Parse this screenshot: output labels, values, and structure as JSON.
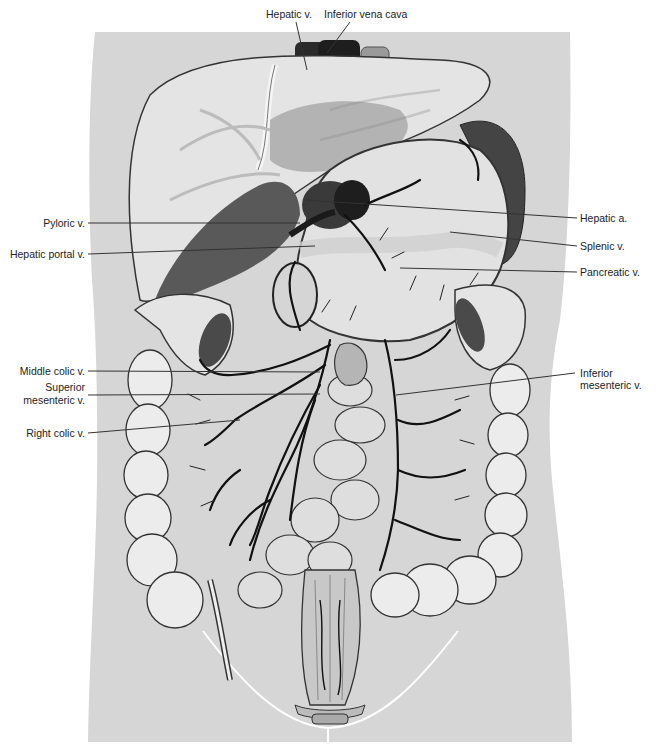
{
  "figure": {
    "colors": {
      "page_background": "#ffffff",
      "body_silhouette": "#d6d6d6",
      "organ_light": "#e8e8e8",
      "organ_mid": "#bdbdbd",
      "organ_dark": "#5a5a5a",
      "vessel": "#1a1a1a",
      "leader_line": "#333333",
      "pelvic_line": "#ffffff",
      "label_text": "#222222"
    }
  },
  "labels": {
    "top": [
      {
        "id": "hepatic-v",
        "text": "Hepatic v.",
        "x": 266,
        "y": 8
      },
      {
        "id": "inferior-vena-cava",
        "text": "Inferior vena cava",
        "x": 324,
        "y": 8
      }
    ],
    "left": [
      {
        "id": "pyloric-v",
        "text": "Pyloric v.",
        "right": 575,
        "y": 217
      },
      {
        "id": "hepatic-portal-v",
        "text": "Hepatic portal v.",
        "right": 575,
        "y": 248
      },
      {
        "id": "middle-colic-v",
        "text": "Middle colic v.",
        "right": 575,
        "y": 365
      },
      {
        "id": "superior-mesenteric-v-line1",
        "text": "Superior",
        "right": 575,
        "y": 383
      },
      {
        "id": "superior-mesenteric-v-line2",
        "text": "mesenteric v.",
        "right": 575,
        "y": 395
      },
      {
        "id": "right-colic-v",
        "text": "Right colic v.",
        "right": 575,
        "y": 427
      }
    ],
    "right": [
      {
        "id": "hepatic-a",
        "text": "Hepatic a.",
        "x": 580,
        "y": 212
      },
      {
        "id": "splenic-v",
        "text": "Splenic v.",
        "x": 580,
        "y": 240
      },
      {
        "id": "pancreatic-v",
        "text": "Pancreatic v.",
        "x": 580,
        "y": 266
      },
      {
        "id": "inferior-mesenteric-v-line1",
        "text": "Inferior",
        "x": 580,
        "y": 367
      },
      {
        "id": "inferior-mesenteric-v-line2",
        "text": "mesenteric v.",
        "x": 580,
        "y": 379
      }
    ]
  },
  "leader_lines": [
    {
      "for": "hepatic-v",
      "x1": 296,
      "y1": 22,
      "x2": 307,
      "y2": 70
    },
    {
      "for": "inferior-vena-cava",
      "x1": 350,
      "y1": 22,
      "x2": 327,
      "y2": 53
    },
    {
      "for": "pyloric-v",
      "x1": 88,
      "y1": 223,
      "x2": 300,
      "y2": 223
    },
    {
      "for": "hepatic-portal-v",
      "x1": 88,
      "y1": 254,
      "x2": 315,
      "y2": 246
    },
    {
      "for": "hepatic-a",
      "x1": 305,
      "y1": 200,
      "x2": 577,
      "y2": 218
    },
    {
      "for": "splenic-v",
      "x1": 450,
      "y1": 232,
      "x2": 577,
      "y2": 246
    },
    {
      "for": "pancreatic-v",
      "x1": 400,
      "y1": 268,
      "x2": 577,
      "y2": 272
    },
    {
      "for": "middle-colic-v",
      "x1": 88,
      "y1": 371,
      "x2": 320,
      "y2": 372
    },
    {
      "for": "superior-mesenteric-v",
      "x1": 88,
      "y1": 395,
      "x2": 320,
      "y2": 394
    },
    {
      "for": "right-colic-v",
      "x1": 88,
      "y1": 433,
      "x2": 240,
      "y2": 420
    },
    {
      "for": "inferior-mesenteric-v",
      "x1": 396,
      "y1": 395,
      "x2": 575,
      "y2": 373
    }
  ]
}
